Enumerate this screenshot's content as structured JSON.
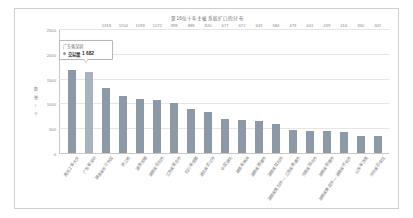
{
  "chart_data": {
    "type": "bar",
    "title": "第16位十年主被系统扩口的分布",
    "xlabel": "",
    "ylabel": "数 量 / 个",
    "ylim": [
      0,
      2500
    ],
    "yticks": [
      0,
      500,
      1000,
      1500,
      2000,
      2500
    ],
    "grid": true,
    "legend": null,
    "categories": [
      "黑龙江省大庆",
      "广东省深圳",
      "湖南省长沙市区",
      "浙江杭",
      "湖南常德",
      "湖南省岳阳市",
      "江苏省南京市",
      "四川省成都",
      "湖北省武汉市",
      "中国湖北",
      "湖南省株洲",
      "湖南省湘潭市",
      "湖南省益阳市",
      "湖南省衡阳市 — 江苏省南通市",
      "河南省郑州市",
      "湖南省常德市",
      "湖南省娄底市 — 湖南省怀化市",
      "山东省济南",
      "河北省石家庄"
    ],
    "values": [
      1682,
      1640,
      1318,
      1154,
      1093,
      1072,
      999,
      888,
      820,
      677,
      672,
      643,
      584,
      473,
      441,
      439,
      416,
      350,
      347
    ],
    "value_labels": [
      "",
      "",
      "1318",
      "1154",
      "1093",
      "1072",
      "999",
      "888",
      "820",
      "677",
      "672",
      "643",
      "584",
      "473",
      "441",
      "439",
      "416",
      "350",
      "347"
    ],
    "highlight_index": 1,
    "colors": {
      "bar": "#8c9aa8",
      "bar_highlight": "#a8b3bd",
      "grid": "#e6e6e6",
      "axis": "#c8c8c8",
      "tick_text": "#8a8a8a",
      "title_text": "#6d6d6d",
      "card_border": "#cfcfcf",
      "background": "#ffffff"
    }
  },
  "tooltip": {
    "title": "广东省深圳",
    "series_label": "交易量",
    "value": "1 682"
  }
}
